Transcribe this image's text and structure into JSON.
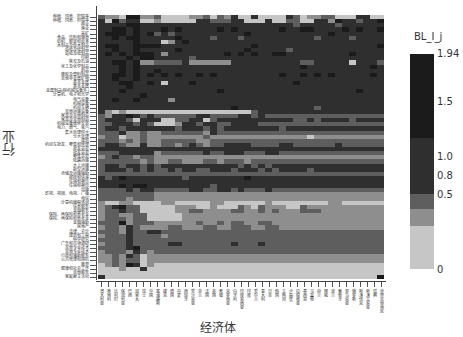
{
  "chart_data": {
    "type": "heatmap",
    "title": "",
    "xlabel": "经济体",
    "ylabel": "行业",
    "colorbar": {
      "title": "BL_I_j",
      "ticks": [
        "0",
        "0.5",
        "0.8",
        "1.0",
        "1.5",
        "1.94"
      ],
      "bins": [
        {
          "range": [
            0,
            0.5
          ],
          "color": "#c6c6c6"
        },
        {
          "range": [
            0.5,
            0.8
          ],
          "color": "#8e8e8e"
        },
        {
          "range": [
            0.8,
            1.0
          ],
          "color": "#5e5e5e"
        },
        {
          "range": [
            1.0,
            1.5
          ],
          "color": "#2f2f2f"
        },
        {
          "range": [
            1.5,
            1.94
          ],
          "color": "#1b1b1b"
        }
      ]
    },
    "n_rows": 64,
    "n_cols": 41,
    "y_tick_labels_sample": [
      "种植、饲养、狩猎等",
      "林业",
      "渔业",
      "采矿",
      "食品、饮料和烟草",
      "纺织、服装和皮革",
      "木制品及软木制品",
      "造纸及纸制品",
      "印刷",
      "焦炭及石油",
      "化工及化学制品",
      "药品",
      "橡胶及塑料制品",
      "其他非金属矿物",
      "基本金属",
      "金属制品(除机械设备外)",
      "计算机、电子和光学",
      "电气设备",
      "机械设备",
      "机动车辆",
      "其他运输设备",
      "家具及其他制造",
      "机械设备维修安装",
      "电力、燃气、蒸汽",
      "集水处理供水",
      "污水处理",
      "建筑",
      "机动车批发、零售和修理",
      "批发贸易",
      "零售贸易",
      "陆路运输",
      "水上运输",
      "航空运输",
      "仓储及运输辅助",
      "邮政和快递",
      "住宿和餐饮",
      "出版",
      "影视、视频、电视、广播",
      "电信",
      "计算机编程咨询",
      "信息服务",
      "金融服务",
      "保险、再保险和养老金",
      "金融辅助",
      "房地产",
      "法律、会计",
      "建筑和工程",
      "科学研究",
      "广告和市场调研",
      "其他专业技术",
      "行政和辅助服务",
      "公共管理和国防",
      "教育",
      "健康和社会工作",
      "其他服务",
      "家庭雇主活动"
    ],
    "x_tick_labels_sample": [
      "澳大利亚",
      "奥地利",
      "比利时",
      "保加利亚",
      "巴西",
      "加拿大",
      "瑞士",
      "中国",
      "塞浦路斯",
      "捷克",
      "德国",
      "丹麦",
      "西班牙",
      "爱沙尼亚",
      "芬兰",
      "法国",
      "英国",
      "希腊",
      "克罗地亚",
      "匈牙利",
      "印度尼西亚",
      "印度",
      "爱尔兰",
      "意大利",
      "日本",
      "韩国",
      "立陶宛",
      "卢森堡",
      "拉脱维亚",
      "墨西哥",
      "马耳他",
      "荷兰",
      "挪威",
      "波兰",
      "葡萄牙",
      "罗马尼亚",
      "俄罗斯",
      "斯洛伐克",
      "斯洛文尼亚",
      "瑞典",
      "世界其他地区"
    ],
    "rows": [
      "21104411200001120213003000032011220003300",
      "30423300100000332223300030022003314332334",
      "33334433333333333333333333332333332333333",
      "33443433343433333434333333433443333434334",
      "34443434232333333333343333333333343333333",
      "33434433333433332333233333333332333323333",
      "33333433301343333333333333333333333333333",
      "34433444433333333333334333333333333333334",
      "33433433333433333333343333323333333333333",
      "34343444313333333343434334433333333343333",
      "33334344333332333333333333333333333333333",
      "33443411222231111113333333333223333303332",
      "33343433333333333333333333333433333333343",
      "33343433433333333333333333333333333333333",
      "33443434343433434333333333433434343333343",
      "33433433333333333333333333333333333333333",
      "33344334303334333333333333334333333333333",
      "33334333333333333333333333333333333333333",
      "33343333333333333433333333333333333334333",
      "33333343333333333333333333333333333333333",
      "33433433331333333333333333333333333333333",
      "33333333333333333333333333333333333333333",
      "33333333333333333334333333333332333333333",
      "31010000000000000000002333333333333333333",
      "21334323222222332222332322222222222222222",
      "23332033300223302333333333332232333323333",
      "22333232000133233223333222222222222222222",
      "23323333333233323233333333233333333333333",
      "22231121122222213222222222222222222222222",
      "12201121111111121111111111111101111111111",
      "22212121122222112222222222222222222222222",
      "23321131122123212233332222332222223222222",
      "33333333333333333333333333333333333333333",
      "22233333122222232233322233222222222222222",
      "12322122111111111111111111111111111111111",
      "22222212112211122122212222222222222222222",
      "23323323233333333333232323333333333333333",
      "23332323223233223332333232333323333333333",
      "22222222222222222222222222222222222222222",
      "32343333333323333333343333333333333333333",
      "33333333333333333333333333333333333333333",
      "33343443333333332333333333333333333333333",
      "22223233222223322332322232222222222222222",
      "22222222111111111111111111111111111111111",
      "22221222111111111111111111111111111111111",
      "10011000011000001100000010000000011000000",
      "12342200000111001000210211100211111111111",
      "12232200000112211112211212111222111111111",
      "12211220000011111111111111111111111111111",
      "12221220000011111111111111111111111111111",
      "22241222111111211212211221111111111111111",
      "12213211112211122112221122111111111111111",
      "22213223322222222222222222222222222222222",
      "12223222212222222222222222222222222222222",
      "22223222222222222222222222222222222222222",
      "12223222223322222223222322222222222222222",
      "22223422222222222222222222222222222222222",
      "12221321222222222222222222222222222222222",
      "11213201111111111111111111111111111111111",
      "11212201111111111111111111111111111111111",
      "01214301000000000000000000000000000000000",
      "00010030000000000000000000000000000000000",
      "00000000000000000000000000000000000000000",
      "30000000000000000000000000000000000000004"
    ]
  }
}
